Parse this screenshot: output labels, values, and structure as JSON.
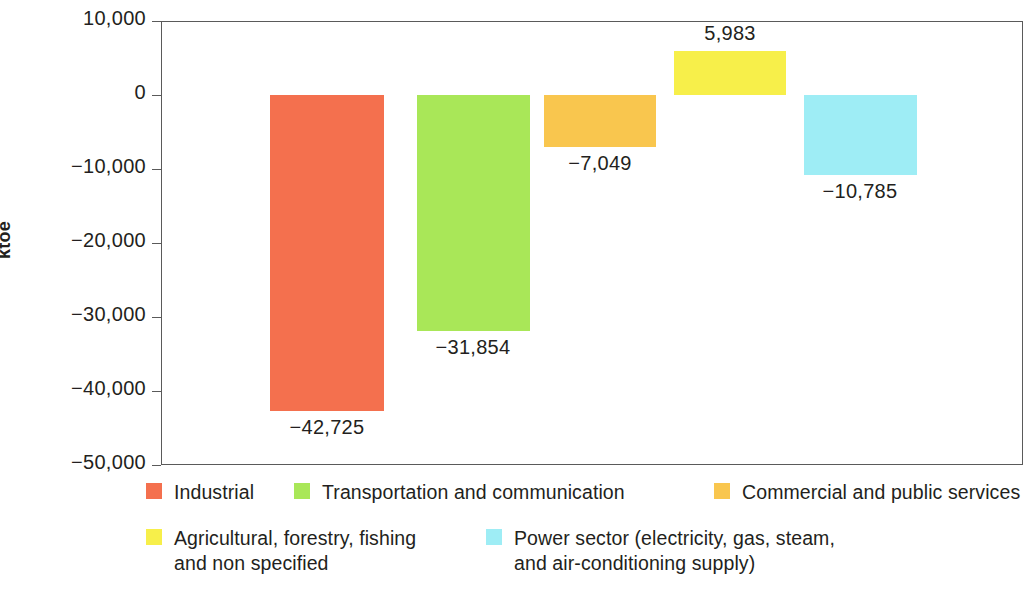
{
  "chart_data": {
    "type": "bar",
    "title": "",
    "subtitle": "",
    "xlabel": "",
    "ylabel": "ktoe",
    "ylim": [
      -50000,
      10000
    ],
    "ytick_labels": [
      "10,000",
      "0",
      "−10,000",
      "−20,000",
      "−30,000",
      "−40,000",
      "−50,000"
    ],
    "ytick_values": [
      10000,
      0,
      -10000,
      -20000,
      -30000,
      -40000,
      -50000
    ],
    "grid": false,
    "legend_position": "bottom",
    "categories": [
      "Industrial",
      "Transportation and communication",
      "Commercial and public services",
      "Agricultural, forestry, fishing and non specified",
      "Power sector (electricity, gas, steam, and air-conditioning supply)"
    ],
    "values": [
      -42725,
      -31854,
      -7049,
      5983,
      -10785
    ],
    "data_labels": [
      "−42,725",
      "−31,854",
      "−7,049",
      "5,983",
      "−10,785"
    ],
    "colors": [
      "#F4704E",
      "#A9E758",
      "#F9C council",
      "#F7EF4A",
      "#9EEDF5"
    ],
    "series": [
      {
        "name": "Final energy consumption change",
        "values": [
          -42725,
          -31854,
          -7049,
          5983,
          -10785
        ]
      }
    ]
  },
  "axis": {
    "y_title": "ktoe"
  },
  "bars": [
    {
      "name": "industrial",
      "label": "−42,725",
      "color": "#F4704E",
      "value": -42725
    },
    {
      "name": "transportation",
      "label": "−31,854",
      "color": "#A9E758",
      "value": -31854
    },
    {
      "name": "commercial",
      "label": "−7,049",
      "color": "#F9C64E",
      "value": -7049
    },
    {
      "name": "agricultural",
      "label": "5,983",
      "color": "#F7EF4A",
      "value": 5983
    },
    {
      "name": "power-sector",
      "label": "−10,785",
      "color": "#9EEDF5",
      "value": -10785
    }
  ],
  "ticks": [
    {
      "label": "10,000"
    },
    {
      "label": "0"
    },
    {
      "label": "−10,000"
    },
    {
      "label": "−20,000"
    },
    {
      "label": "−30,000"
    },
    {
      "label": "−40,000"
    },
    {
      "label": "−50,000"
    }
  ],
  "legend": {
    "row1": [
      {
        "label": "Industrial",
        "color": "#F4704E"
      },
      {
        "label": "Transportation and communication",
        "color": "#A9E758"
      },
      {
        "label": "Commercial and public services",
        "color": "#F9C64E"
      }
    ],
    "row2": [
      {
        "label": "Agricultural, forestry, fishing\nand non specified",
        "color": "#F7EF4A"
      },
      {
        "label": "Power sector (electricity, gas, steam,\nand air-conditioning supply)",
        "color": "#9EEDF5"
      }
    ]
  }
}
